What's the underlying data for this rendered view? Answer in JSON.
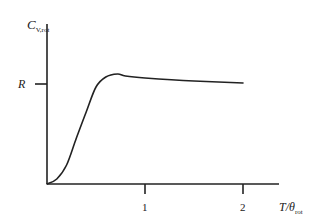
{
  "chart_data": {
    "type": "line",
    "title": "",
    "xlabel": "T/θrot",
    "xlabel_main": "T/θ",
    "xlabel_sub": "rot",
    "ylabel": "Cv,rot",
    "ylabel_main": "C",
    "ylabel_sub": "V,rot",
    "x_ticks": [
      {
        "value": 1,
        "label": "1"
      },
      {
        "value": 2,
        "label": "2"
      }
    ],
    "y_ticks": [
      {
        "value": 1,
        "label": "R"
      }
    ],
    "xlim": [
      0,
      2.35
    ],
    "ylim": [
      0,
      1.5
    ],
    "grid": false,
    "legend": null,
    "series": [
      {
        "name": "Cv,rot",
        "units": "R",
        "x": [
          0,
          0.1,
          0.2,
          0.3,
          0.4,
          0.5,
          0.6,
          0.72,
          0.8,
          1.0,
          1.5,
          2.0
        ],
        "y": [
          0,
          0.05,
          0.19,
          0.46,
          0.72,
          0.97,
          1.07,
          1.1,
          1.08,
          1.06,
          1.03,
          1.01
        ]
      }
    ]
  },
  "layout": {
    "origin_px": [
      47,
      184
    ],
    "x_px_per_unit": 98,
    "y_px_per_unit": 100,
    "x_axis_end_px": 279,
    "y_axis_top_px": 24,
    "line_color": "#222222"
  }
}
